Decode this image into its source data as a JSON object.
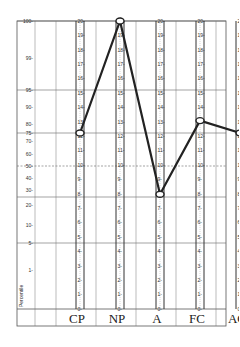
{
  "chart_data": {
    "type": "line",
    "title": "",
    "xlabel": "",
    "ylabel": "Percentile",
    "side_label": "Percentile",
    "categories": [
      "CP",
      "NP",
      "A",
      "FC",
      "AC"
    ],
    "series": [
      {
        "name": "Profile",
        "raw_scores": [
          12,
          20,
          6,
          16,
          12
        ],
        "percentiles": [
          75,
          100,
          27,
          82,
          75
        ]
      }
    ],
    "percentile_ticks": [
      100,
      99,
      95,
      90,
      80,
      75,
      70,
      60,
      50,
      40,
      30,
      20,
      10,
      5,
      1
    ],
    "reference_lines": [
      {
        "percentile": 100,
        "style": "solid"
      },
      {
        "percentile": 95,
        "style": "solid"
      },
      {
        "percentile": 75,
        "style": "solid"
      },
      {
        "percentile": 50,
        "style": "dashed"
      },
      {
        "percentile": 25,
        "style": "solid"
      },
      {
        "percentile": 5,
        "style": "solid"
      }
    ],
    "column_scales": {
      "CP": [
        "20",
        "19",
        "18",
        "17",
        "16",
        "15",
        "14",
        "13",
        "12",
        "11",
        "10",
        "9",
        "8",
        "7",
        "6",
        "5",
        "4",
        "3",
        "2",
        "1",
        "0"
      ],
      "NP": [
        "20",
        "19",
        "18",
        "17",
        "16",
        "15",
        "14",
        "13",
        "12",
        "11",
        "10",
        "9",
        "8",
        "7",
        "6",
        "5",
        "4",
        "3",
        "2",
        "1",
        "0"
      ],
      "A": [
        "20",
        "19",
        "18",
        "17",
        "16",
        "15",
        "14",
        "13",
        "12",
        "11",
        "10",
        "9",
        "8",
        "7",
        "6",
        "5",
        "4",
        "3",
        "2",
        "1",
        "0"
      ],
      "FC": [
        "20",
        "19",
        "18",
        "17",
        "16",
        "15",
        "14",
        "13",
        "12",
        "11",
        "10",
        "9",
        "8",
        "7",
        "6",
        "5",
        "4",
        "3",
        "2",
        "1",
        "0"
      ],
      "AC": [
        "20",
        "19",
        "18",
        "17",
        "16",
        "15",
        "14",
        "13",
        "12",
        "11",
        "10",
        "9",
        "8",
        "7",
        "6",
        "5",
        "4",
        "3",
        "2",
        "1",
        "0"
      ]
    },
    "ylim": [
      0,
      100
    ],
    "grid": true,
    "legend": "none"
  }
}
